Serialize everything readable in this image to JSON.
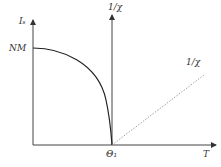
{
  "diagram": {
    "title": "",
    "labels": {
      "y_axis": "Iₛ",
      "nm": "NM",
      "chi_axis": "1/χ",
      "chi_line": "1/χ",
      "theta": "Θ₁",
      "t_axis": "T"
    },
    "colors": {
      "axis": "#333333",
      "curve": "#222222",
      "dotted": "#888888",
      "text": "#333333"
    }
  }
}
